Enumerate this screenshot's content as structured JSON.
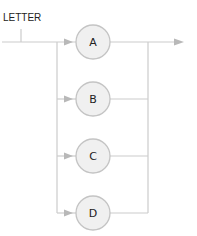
{
  "diagram": {
    "type": "railroad-syntax",
    "rule_name": "LETTER",
    "alternatives": [
      {
        "label": "A"
      },
      {
        "label": "B"
      },
      {
        "label": "C"
      },
      {
        "label": "D"
      }
    ],
    "colors": {
      "line": "#c8c8c8",
      "node_fill": "#f0f0f0",
      "node_stroke": "#c0c0c0",
      "arrow": "#b4b4b4",
      "text": "#222222"
    }
  }
}
